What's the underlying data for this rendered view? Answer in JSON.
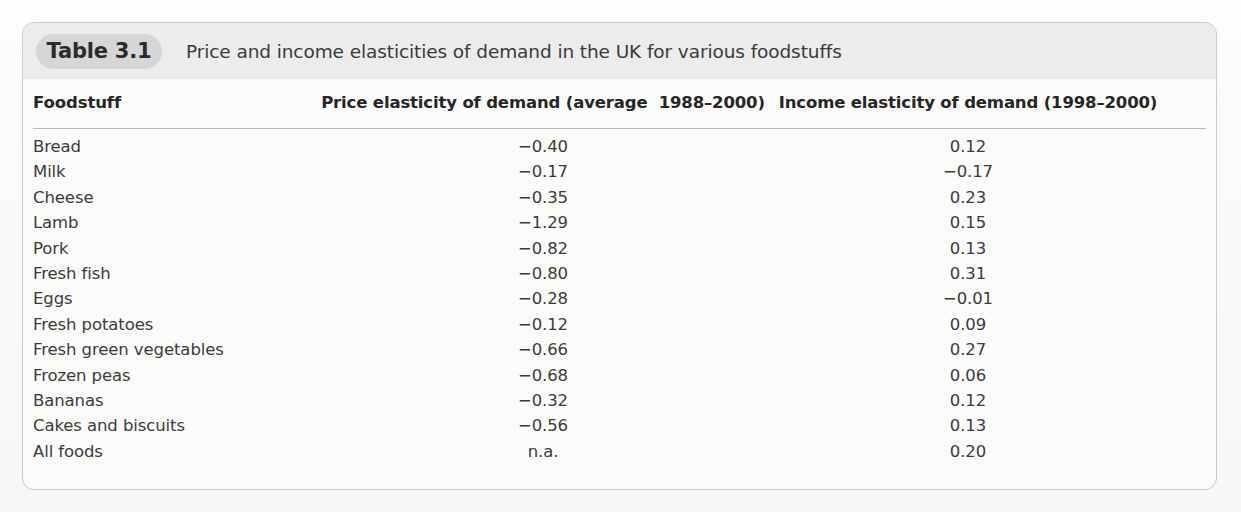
{
  "table": {
    "badge_label": "Table 3.1",
    "caption": "Price and income elasticities of demand in the UK for various foodstuffs",
    "columns": {
      "foodstuff": "Foodstuff",
      "price_elasticity": "Price elasticity of demand (average  1988–2000)",
      "income_elasticity": "Income elasticity of demand (1998–2000)"
    },
    "rows": [
      {
        "foodstuff": "Bread",
        "price_elasticity": "−0.40",
        "income_elasticity": "0.12"
      },
      {
        "foodstuff": "Milk",
        "price_elasticity": "−0.17",
        "income_elasticity": "−0.17"
      },
      {
        "foodstuff": "Cheese",
        "price_elasticity": "−0.35",
        "income_elasticity": "0.23"
      },
      {
        "foodstuff": "Lamb",
        "price_elasticity": "−1.29",
        "income_elasticity": "0.15"
      },
      {
        "foodstuff": "Pork",
        "price_elasticity": "−0.82",
        "income_elasticity": "0.13"
      },
      {
        "foodstuff": "Fresh fish",
        "price_elasticity": "−0.80",
        "income_elasticity": "0.31"
      },
      {
        "foodstuff": "Eggs",
        "price_elasticity": "−0.28",
        "income_elasticity": "−0.01"
      },
      {
        "foodstuff": "Fresh potatoes",
        "price_elasticity": "−0.12",
        "income_elasticity": "0.09"
      },
      {
        "foodstuff": "Fresh green vegetables",
        "price_elasticity": "−0.66",
        "income_elasticity": "0.27"
      },
      {
        "foodstuff": "Frozen peas",
        "price_elasticity": "−0.68",
        "income_elasticity": "0.06"
      },
      {
        "foodstuff": "Bananas",
        "price_elasticity": "−0.32",
        "income_elasticity": "0.12"
      },
      {
        "foodstuff": "Cakes and biscuits",
        "price_elasticity": "−0.56",
        "income_elasticity": "0.13"
      },
      {
        "foodstuff": "All foods",
        "price_elasticity": "n.a.",
        "income_elasticity": "0.20"
      }
    ]
  },
  "chart_data": {
    "type": "table",
    "title": "Price and income elasticities of demand in the UK for various foodstuffs",
    "categories": [
      "Bread",
      "Milk",
      "Cheese",
      "Lamb",
      "Pork",
      "Fresh fish",
      "Eggs",
      "Fresh potatoes",
      "Fresh green vegetables",
      "Frozen peas",
      "Bananas",
      "Cakes and biscuits",
      "All foods"
    ],
    "series": [
      {
        "name": "Price elasticity of demand (average  1988–2000)",
        "values": [
          -0.4,
          -0.17,
          -0.35,
          -1.29,
          -0.82,
          -0.8,
          -0.28,
          -0.12,
          -0.66,
          -0.68,
          -0.32,
          -0.56,
          null
        ]
      },
      {
        "name": "Income elasticity of demand (1998–2000)",
        "values": [
          0.12,
          -0.17,
          0.23,
          0.15,
          0.13,
          0.31,
          -0.01,
          0.09,
          0.27,
          0.06,
          0.12,
          0.13,
          0.2
        ]
      }
    ],
    "xlabel": "Foodstuff",
    "ylabel": "Elasticity",
    "grid": false,
    "legend": "none"
  },
  "colors": {
    "frame_border": "#c9c9c9",
    "title_band": "#ececec",
    "badge": "#d6d6d6",
    "rule": "#b9b9b9",
    "text": "#3b3b3b",
    "header_text": "#262626"
  }
}
